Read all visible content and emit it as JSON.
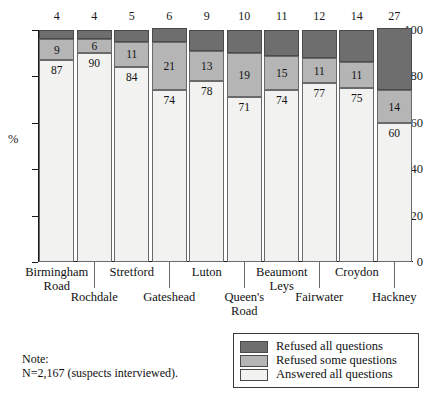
{
  "chart_data": {
    "type": "bar",
    "subtype": "stacked-bar-100",
    "title": "",
    "xlabel": "",
    "ylabel": "%",
    "ylim": [
      0,
      100
    ],
    "yticks": [
      0,
      20,
      40,
      60,
      80,
      100
    ],
    "grid": false,
    "legend_position": "bottom-right",
    "categories": [
      "Birmingham Road",
      "Rochdale",
      "Stretford",
      "Gateshead",
      "Luton",
      "Queen's Road",
      "Beaumont Leys",
      "Fairwater",
      "Croydon",
      "Hackney"
    ],
    "series": [
      {
        "name": "Answered all questions",
        "color": "#f2f2f0",
        "values": [
          87,
          90,
          84,
          74,
          78,
          71,
          74,
          77,
          75,
          60
        ]
      },
      {
        "name": "Refused some questions",
        "color": "#b5b5b5",
        "values": [
          9,
          6,
          11,
          21,
          13,
          19,
          15,
          11,
          11,
          14
        ]
      },
      {
        "name": "Refused all questions",
        "color": "#6e6e6e",
        "values": [
          4,
          4,
          5,
          6,
          9,
          10,
          11,
          12,
          14,
          27
        ]
      }
    ],
    "top_value_labels": [
      4,
      4,
      5,
      6,
      9,
      10,
      11,
      12,
      14,
      27
    ],
    "annotations": {
      "note_title": "Note:",
      "note_body": "N=2,167 (suspects interviewed)."
    }
  },
  "axis": {
    "y_unit_label": "%",
    "y_tick_labels": [
      "100",
      "80",
      "60",
      "40",
      "20",
      "0"
    ]
  },
  "x_categories": [
    {
      "line1": "Birmingham",
      "line2": "Road",
      "row": 0
    },
    {
      "line1": "Rochdale",
      "line2": "",
      "row": 1
    },
    {
      "line1": "Stretford",
      "line2": "",
      "row": 0
    },
    {
      "line1": "Gateshead",
      "line2": "",
      "row": 1
    },
    {
      "line1": "Luton",
      "line2": "",
      "row": 0
    },
    {
      "line1": "Queen's",
      "line2": "Road",
      "row": 1
    },
    {
      "line1": "Beaumont",
      "line2": "Leys",
      "row": 0
    },
    {
      "line1": "Fairwater",
      "line2": "",
      "row": 1
    },
    {
      "line1": "Croydon",
      "line2": "",
      "row": 0
    },
    {
      "line1": "Hackney",
      "line2": "",
      "row": 1
    }
  ],
  "legend": {
    "items": [
      {
        "label": "Refused all questions",
        "color": "#6e6e6e"
      },
      {
        "label": "Refused some questions",
        "color": "#b5b5b5"
      },
      {
        "label": "Answered all questions",
        "color": "#f2f2f0"
      }
    ]
  },
  "note": {
    "title": "Note:",
    "body": "N=2,167 (suspects interviewed)."
  },
  "inner_labels": {
    "answered": [
      "87",
      "90",
      "84",
      "74",
      "78",
      "71",
      "74",
      "77",
      "75",
      "60"
    ],
    "refused_some": [
      "9",
      "6",
      "11",
      "21",
      "13",
      "19",
      "15",
      "11",
      "11",
      "14"
    ]
  }
}
